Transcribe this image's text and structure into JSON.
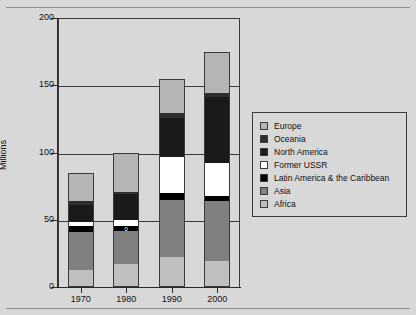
{
  "figure": {
    "cropped_title": "",
    "y_axis_title": "Millions"
  },
  "chart_data": {
    "type": "bar",
    "subtype": "stacked-vertical",
    "title": "",
    "xlabel": "",
    "ylabel": "Millions",
    "ylim": [
      0,
      200
    ],
    "yticks": [
      0,
      50,
      100,
      150,
      200
    ],
    "ytick_labels": [
      "0",
      "50",
      "100",
      "150",
      "200"
    ],
    "grid": true,
    "grid_axis": "y",
    "legend_position": "right",
    "categories": [
      "1970",
      "1980",
      "1990",
      "2000"
    ],
    "series": [
      {
        "name": "Africa",
        "color": "#c0c0c0",
        "values": [
          13,
          17,
          22,
          19
        ]
      },
      {
        "name": "Asia",
        "color": "#808080",
        "values": [
          28,
          25,
          43,
          45
        ]
      },
      {
        "name": "Latin America & the Caribbean",
        "color": "#000000",
        "values": [
          4,
          3,
          5,
          4
        ]
      },
      {
        "name": "Former USSR",
        "color": "#ffffff",
        "values": [
          3,
          5,
          27,
          24
        ]
      },
      {
        "name": "North America",
        "color": "#1a1a1a",
        "values": [
          13,
          19,
          29,
          49
        ]
      },
      {
        "name": "Oceania",
        "color": "#2e2e2e",
        "values": [
          3,
          2,
          3,
          3
        ]
      },
      {
        "name": "Europe",
        "color": "#b5b5b5",
        "values": [
          21,
          29,
          26,
          31
        ]
      }
    ],
    "totals": [
      85,
      100,
      155,
      175
    ],
    "data_labels": [
      {
        "category": "1980",
        "series": "Latin America & the Caribbean",
        "text": "0"
      }
    ]
  },
  "legend": {
    "items": [
      {
        "label": "Europe",
        "color": "#b5b5b5"
      },
      {
        "label": "Oceania",
        "color": "#2e2e2e"
      },
      {
        "label": "North America",
        "color": "#1a1a1a"
      },
      {
        "label": "Former USSR",
        "color": "#ffffff"
      },
      {
        "label": "Latin America & the Caribbean",
        "color": "#000000"
      },
      {
        "label": "Asia",
        "color": "#808080"
      },
      {
        "label": "Africa",
        "color": "#c0c0c0"
      }
    ]
  }
}
